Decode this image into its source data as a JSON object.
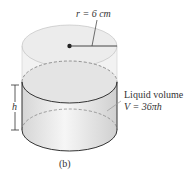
{
  "figure": {
    "radius_label": "r = 6 cm",
    "height_label": "h",
    "liquid_label_line1": "Liquid volume",
    "liquid_label_line2": "V = 36πh",
    "caption": "(b)"
  },
  "colors": {
    "outline": "#444444",
    "fill_top": "#ebebeb",
    "fill_liquid": "#dcdcdc"
  }
}
